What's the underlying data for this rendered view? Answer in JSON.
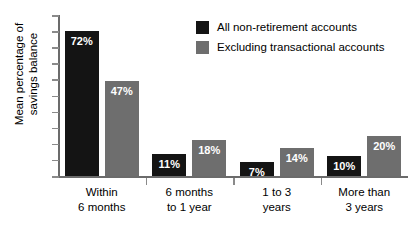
{
  "chart_data": {
    "type": "bar",
    "title": "",
    "subtitle": "",
    "xlabel": "",
    "ylabel": "Mean percentage of savings balance",
    "ylabel_line1": "Mean percentage of",
    "ylabel_line2": "savings balance",
    "ylim": [
      0,
      80
    ],
    "grid": false,
    "axis_tick_labels_shown": false,
    "legend_position": "top-right",
    "categories": [
      "Within 6 months",
      "6 months to 1 year",
      "1 to 3 years",
      "More than 3 years"
    ],
    "category_lines": [
      [
        "Within",
        "6 months"
      ],
      [
        "6 months",
        "to 1 year"
      ],
      [
        "1 to 3",
        "years"
      ],
      [
        "More than",
        "3 years"
      ]
    ],
    "series": [
      {
        "name": "All non-retirement accounts",
        "color": "#141414",
        "values": [
          72,
          11,
          7,
          10
        ],
        "labels": [
          "72%",
          "11%",
          "7%",
          "10%"
        ]
      },
      {
        "name": "Excluding transactional accounts",
        "color": "#6e6e6e",
        "values": [
          47,
          18,
          14,
          20
        ],
        "labels": [
          "47%",
          "18%",
          "14%",
          "20%"
        ]
      }
    ]
  },
  "legend": {
    "items": [
      {
        "label": "All non-retirement accounts",
        "color": "#141414"
      },
      {
        "label": "Excluding transactional accounts",
        "color": "#6e6e6e"
      }
    ]
  },
  "axes": {
    "y_tick_count": 11,
    "x_separator_count": 3,
    "axis_color": "#6b6b6b"
  }
}
